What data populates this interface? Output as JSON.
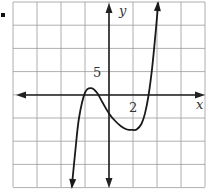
{
  "figure": {
    "bullet": "■"
  },
  "chart_data": {
    "type": "line",
    "title": "",
    "xlabel": "x",
    "ylabel": "y",
    "x_tick_label": {
      "value": 2,
      "text": "2"
    },
    "y_tick_label": {
      "value": 5,
      "text": "5"
    },
    "grid": true,
    "xlim": [
      -8,
      8
    ],
    "ylim": [
      -20,
      20
    ],
    "x_grid_step": 2,
    "y_grid_step": 5,
    "series": [
      {
        "name": "polynomial curve",
        "description": "cubic with local max near (-1.5, 1.5), local min near (2.3, -7.5), arrows at both ends",
        "x": [
          -3.1,
          -2.8,
          -2.5,
          -2.0,
          -1.5,
          -1.0,
          -0.5,
          0,
          0.5,
          1.0,
          1.5,
          2.0,
          2.3,
          2.7,
          3.0,
          3.3,
          3.6,
          3.9,
          4.1
        ],
        "y": [
          -20,
          -12,
          -5,
          0.5,
          1.5,
          0.5,
          -1.8,
          -4,
          -5.6,
          -6.8,
          -7.5,
          -7.6,
          -7.5,
          -6.3,
          -4,
          0,
          6,
          14,
          20
        ]
      }
    ],
    "colors": {
      "axis": "#222222",
      "grid": "#9a9a9a",
      "curve": "#1a1a1a"
    }
  }
}
